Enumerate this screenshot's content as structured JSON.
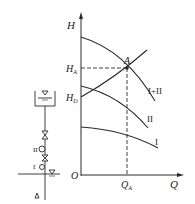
{
  "diagram": {
    "type": "pump-series-characteristic",
    "axes": {
      "y_label": "H",
      "x_label": "Q",
      "origin_label": "O"
    },
    "markers": {
      "point_label": "A",
      "ha_label": "H",
      "ha_sub": "A",
      "hd_label": "H",
      "hd_sub": "D",
      "qa_label": "Q",
      "qa_sub": "A"
    },
    "curves": [
      {
        "id": "I+II",
        "label": "I+II"
      },
      {
        "id": "II",
        "label": "II"
      },
      {
        "id": "I",
        "label": "I"
      },
      {
        "id": "pipeline",
        "label": ""
      }
    ],
    "schematic": {
      "pump_upper_label": "II",
      "pump_lower_label": "I",
      "tank_symbol": "▽",
      "sump_symbol": "▽"
    },
    "colors": {
      "line": "#2a2a2a",
      "background": "#ffffff"
    }
  }
}
